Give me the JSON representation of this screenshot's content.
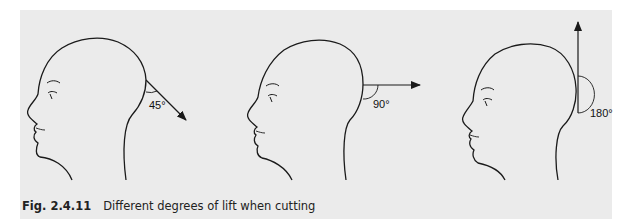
{
  "figure": {
    "number": "Fig. 2.4.11",
    "title": "Different degrees of lift when cutting",
    "panels": [
      {
        "angle_label": "45°",
        "direction": "down-right"
      },
      {
        "angle_label": "90°",
        "direction": "horizontal"
      },
      {
        "angle_label": "180°",
        "direction": "up"
      }
    ]
  },
  "colors": {
    "background": "#ebebeb",
    "line": "#1a1a1a"
  }
}
